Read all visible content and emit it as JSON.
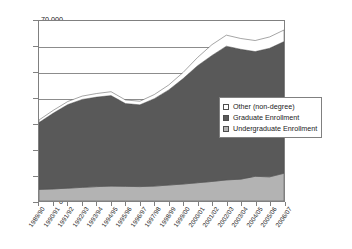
{
  "chart_data": {
    "type": "area",
    "stacked": true,
    "title": "",
    "xlabel": "",
    "ylabel": "",
    "ylim": [
      0,
      70000
    ],
    "ytick_step": 10000,
    "ytick_labels": [
      "70,000",
      "60,000",
      "50,000",
      "40,000",
      "30,000",
      "20,000",
      "10,000",
      "0"
    ],
    "ytick_values": [
      70000,
      60000,
      50000,
      40000,
      30000,
      20000,
      10000,
      0
    ],
    "grid": true,
    "legend_position": "center-right inside plot",
    "categories": [
      "1989/90",
      "1990/91",
      "1991/92",
      "1992/93",
      "1993/94",
      "1994/95",
      "1995/96",
      "1996/97",
      "1997/98",
      "1998/99",
      "1999/00",
      "2000/01",
      "2001/02",
      "2002/03",
      "2003/04",
      "2004/05",
      "2005/06",
      "2006/07"
    ],
    "series": [
      {
        "name": "Undergraduate Enrollment",
        "color": "#b3b3b3",
        "values": [
          4500,
          4700,
          5000,
          5300,
          5600,
          5800,
          5700,
          5600,
          5800,
          6200,
          6600,
          7100,
          7600,
          8200,
          8500,
          9600,
          9400,
          10800
        ]
      },
      {
        "name": "Graduate Enrollment",
        "color": "#595959",
        "values": [
          26000,
          29500,
          32500,
          34200,
          34800,
          35200,
          32200,
          31800,
          34000,
          37000,
          41000,
          45500,
          49000,
          52000,
          50500,
          48500,
          50000,
          51200
        ]
      },
      {
        "name": "Other (non-degree)",
        "color": "#ffffff",
        "values": [
          1000,
          1100,
          1200,
          1300,
          1400,
          1500,
          1400,
          1400,
          1600,
          1900,
          2400,
          3200,
          4200,
          4300,
          4200,
          4300,
          4400,
          4500
        ]
      }
    ],
    "totals": [
      31500,
      35300,
      38700,
      40800,
      41800,
      42500,
      39300,
      38800,
      41400,
      45100,
      50000,
      55800,
      60800,
      64500,
      63200,
      62400,
      63800,
      66500
    ]
  },
  "legend": {
    "items": [
      {
        "label": "Other (non-degree)",
        "color": "#ffffff"
      },
      {
        "label": "Graduate Enrollment",
        "color": "#595959"
      },
      {
        "label": "Undergraduate Enrollment",
        "color": "#b3b3b3"
      }
    ]
  },
  "clipped_header_text": ""
}
